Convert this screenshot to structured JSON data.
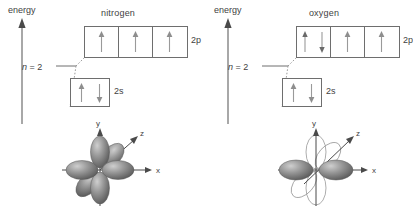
{
  "figure": {
    "background_color": "#ffffff",
    "line_color": "#6e6e6e",
    "text_color": "#3f3f3f",
    "lobe_fill_color": "#8c8c8c"
  },
  "panels": [
    {
      "id": "nitrogen",
      "title": "nitrogen",
      "energy_axis_label": "energy",
      "shell_label": "n = 2",
      "shell_label_italic": "n",
      "shell_label_rest": " = 2",
      "subshells": [
        {
          "name": "2p",
          "label": "2p",
          "boxes": [
            {
              "spins": [
                "up"
              ]
            },
            {
              "spins": [
                "up"
              ]
            },
            {
              "spins": [
                "up"
              ]
            }
          ]
        },
        {
          "name": "2s",
          "label": "2s",
          "boxes": [
            {
              "spins": [
                "up",
                "down"
              ]
            }
          ]
        }
      ],
      "orbital_diagram": {
        "type": "three-p-orbitals-filled",
        "axes": [
          "y",
          "z",
          "x"
        ],
        "axis_labels": {
          "x": "x",
          "y": "y",
          "z": "z"
        },
        "filled_orbitals": [
          "px",
          "py",
          "pz"
        ],
        "outline_orbitals": []
      }
    },
    {
      "id": "oxygen",
      "title": "oxygen",
      "energy_axis_label": "energy",
      "shell_label": "n = 2",
      "shell_label_italic": "n",
      "shell_label_rest": " = 2",
      "subshells": [
        {
          "name": "2p",
          "label": "2p",
          "boxes": [
            {
              "spins": [
                "up",
                "down"
              ]
            },
            {
              "spins": [
                "up"
              ]
            },
            {
              "spins": [
                "up"
              ]
            }
          ]
        },
        {
          "name": "2s",
          "label": "2s",
          "boxes": [
            {
              "spins": [
                "up",
                "down"
              ]
            }
          ]
        }
      ],
      "orbital_diagram": {
        "type": "px-filled-py-pz-outline",
        "axes": [
          "y",
          "z",
          "x"
        ],
        "axis_labels": {
          "x": "x",
          "y": "y",
          "z": "z"
        },
        "filled_orbitals": [
          "px"
        ],
        "outline_orbitals": [
          "py",
          "pz"
        ]
      }
    }
  ]
}
